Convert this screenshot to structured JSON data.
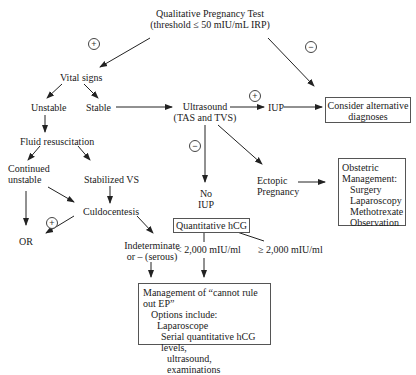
{
  "nodes": {
    "pregnancy_test": {
      "line1": "Qualitative Pregnancy Test",
      "line2": "(threshold ≤ 50 mIU/mL IRP)"
    },
    "vital_signs": "Vital signs",
    "unstable": "Unstable",
    "stable": "Stable",
    "fluid_resuscitation": "Fluid resuscitation",
    "continued_unstable": {
      "line1": "Continued",
      "line2": "unstable"
    },
    "stabilized_vs": "Stabilized VS",
    "culdocentesis": "Culdocentesis",
    "or": "OR",
    "indeterminate": {
      "line1": "Indeterminate",
      "line2": "or – (serous)"
    },
    "ultrasound": {
      "line1": "Ultrasound",
      "line2": "(TAS and TVS)"
    },
    "iup": "IUP",
    "no_iup": {
      "line1": "No",
      "line2": "IUP"
    },
    "ectopic": {
      "line1": "Ectopic",
      "line2": "Pregnancy"
    },
    "consider_alternative": {
      "line1": "Consider alternative",
      "line2": "diagnoses"
    },
    "obstetric_management": {
      "title1": "Obstetric",
      "title2": "Management:",
      "items": [
        "Surgery",
        "Laparoscopy",
        "Methotrexate",
        "Observation"
      ]
    },
    "quantitative_hcg": "Quantitative hCG",
    "hcg_low": "< 2,000 mIU/ml",
    "hcg_high": "≥ 2,000 mIU/ml",
    "cannot_rule_out": {
      "title": "Management of “cannot rule out EP”",
      "subtitle": "Options include:",
      "opt1": "Laparoscope",
      "opt2a": "Serial quantitative hCG levels,",
      "opt2b": "ultrasound, examinations"
    }
  },
  "signs": {
    "test_positive": "+",
    "test_negative": "−",
    "ultrasound_positive": "+",
    "ultrasound_negative": "−",
    "culdocentesis_positive": "+"
  },
  "colors": {
    "line": "#222222",
    "box_border": "#555555",
    "text": "#1a1a1a"
  }
}
